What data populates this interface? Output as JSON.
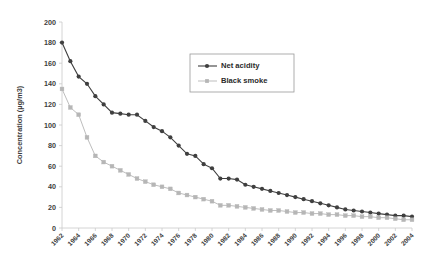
{
  "chart_data": {
    "type": "line",
    "title": "",
    "xlabel": "",
    "ylabel": "Concentration (µg/m3)",
    "ylim": [
      0,
      200
    ],
    "ytick_step": 20,
    "yticks": [
      0,
      20,
      40,
      60,
      80,
      100,
      120,
      140,
      160,
      180,
      200
    ],
    "xlim": [
      1962,
      2004
    ],
    "xtick_step": 2,
    "xticks": [
      1962,
      1964,
      1966,
      1968,
      1970,
      1972,
      1974,
      1976,
      1978,
      1980,
      1982,
      1984,
      1986,
      1988,
      1990,
      1992,
      1994,
      1996,
      1998,
      2000,
      2002,
      2004
    ],
    "grid": false,
    "legend_position": "upper-center",
    "x": [
      1962,
      1963,
      1964,
      1965,
      1966,
      1967,
      1968,
      1969,
      1970,
      1971,
      1972,
      1973,
      1974,
      1975,
      1976,
      1977,
      1978,
      1979,
      1980,
      1981,
      1982,
      1983,
      1984,
      1985,
      1986,
      1987,
      1988,
      1989,
      1990,
      1991,
      1992,
      1993,
      1994,
      1995,
      1996,
      1997,
      1998,
      1999,
      2000,
      2001,
      2002,
      2003,
      2004
    ],
    "series": [
      {
        "name": "Net acidity",
        "color": "#3f3f3f",
        "marker": "diamond",
        "values": [
          180,
          162,
          147,
          140,
          128,
          120,
          112,
          111,
          110,
          110,
          104,
          98,
          94,
          88,
          80,
          72,
          70,
          62,
          58,
          48,
          48,
          47,
          42,
          40,
          38,
          36,
          34,
          32,
          30,
          28,
          26,
          24,
          22,
          20,
          18,
          17,
          16,
          15,
          14,
          13,
          12,
          12,
          11
        ]
      },
      {
        "name": "Black smoke",
        "color": "#b6b6b6",
        "marker": "square",
        "values": [
          135,
          117,
          110,
          88,
          70,
          64,
          60,
          56,
          52,
          48,
          45,
          42,
          40,
          38,
          34,
          32,
          30,
          28,
          26,
          22,
          22,
          21,
          20,
          19,
          18,
          17,
          17,
          16,
          15,
          15,
          14,
          14,
          13,
          13,
          12,
          12,
          11,
          11,
          10,
          10,
          9,
          8,
          8
        ]
      }
    ]
  },
  "legend": {
    "items": [
      {
        "label": "Net acidity"
      },
      {
        "label": "Black smoke"
      }
    ]
  }
}
